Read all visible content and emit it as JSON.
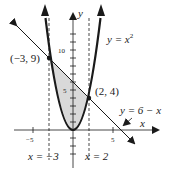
{
  "figure": {
    "curves": {
      "parabola_label": "y = x",
      "parabola_exp": "2",
      "line_label": "y = 6 − x"
    },
    "points": {
      "left_intersection": "(−3, 9)",
      "right_intersection": "(2, 4)"
    },
    "bounds": {
      "left_label": "x = −3",
      "right_label": "x = 2"
    },
    "axes": {
      "x_label": "x",
      "y_label": "y",
      "x_ticks": [
        "−5",
        "5"
      ],
      "y_ticks": [
        "10",
        "5"
      ]
    },
    "colors": {
      "shade": "#d9d9d9",
      "ink": "#1a1a1a"
    }
  }
}
